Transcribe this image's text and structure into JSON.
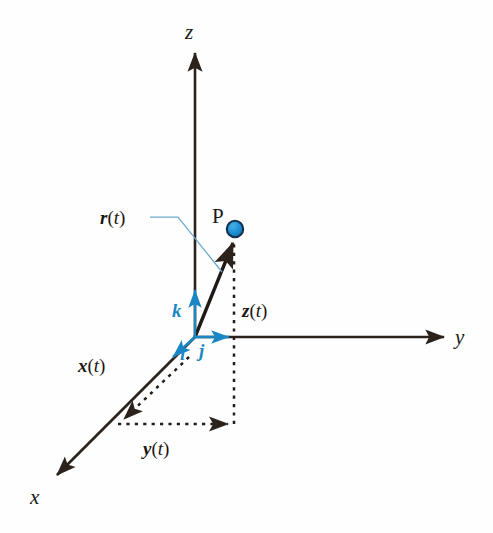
{
  "figure": {
    "background_color": "#fefefe",
    "width": 493,
    "height": 533,
    "colors": {
      "axis": "#2b221c",
      "accent_blue": "#1b86c4",
      "point_fill": "#1b8fd4",
      "point_edge": "#14324d",
      "leader_line": "#6aa9cf",
      "text": "#1d1713"
    }
  },
  "axes": [
    {
      "name": "z-axis",
      "label": "z",
      "direction": "up",
      "label_x": 185,
      "label_y": 22,
      "tip": [
        195,
        50
      ],
      "tail": [
        195,
        337
      ]
    },
    {
      "name": "y-axis",
      "label": "y",
      "direction": "right",
      "label_x": 455,
      "label_y": 327,
      "tip": [
        447,
        337
      ],
      "tail": [
        195,
        337
      ]
    },
    {
      "name": "x-axis",
      "label": "x",
      "direction": "down-left",
      "label_x": 30,
      "label_y": 487,
      "tip": [
        53,
        479
      ],
      "tail": [
        195,
        337
      ]
    }
  ],
  "point": {
    "name": "P",
    "label": "P",
    "label_x": 212,
    "label_y": 206,
    "center_x": 235,
    "center_y": 229,
    "radius": 8
  },
  "position_vector": {
    "name": "r(t)",
    "letter": "r",
    "open_paren": "(",
    "tvar": "t",
    "close_paren": ")",
    "label_x": 100,
    "label_y": 208,
    "from": [
      195,
      337
    ],
    "to": [
      232,
      240
    ],
    "leader_from": [
      150,
      217
    ],
    "leader_bend": [
      178,
      217
    ],
    "leader_to": [
      222,
      272
    ]
  },
  "components": [
    {
      "name": "x-component",
      "letter": "x",
      "open_paren": "(",
      "tvar": "t",
      "close_paren": ")",
      "label_x": 78,
      "label_y": 356,
      "from": [
        188,
        358
      ],
      "to": [
        120,
        423
      ],
      "style": "dashed"
    },
    {
      "name": "y-component",
      "letter": "y",
      "open_paren": "(",
      "tvar": "t",
      "close_paren": ")",
      "label_x": 143,
      "label_y": 439,
      "from": [
        118,
        424
      ],
      "to": [
        232,
        424
      ],
      "style": "dashed"
    },
    {
      "name": "z-component",
      "letter": "z",
      "open_paren": "(",
      "tvar": "t",
      "close_paren": ")",
      "label_x": 242,
      "label_y": 301,
      "from": [
        234,
        424
      ],
      "to": [
        234,
        236
      ],
      "style": "dashed"
    }
  ],
  "unit_vectors": [
    {
      "name": "i-hat",
      "label": "i",
      "label_x": 180,
      "label_y": 344,
      "from": [
        195,
        337
      ],
      "to": [
        170,
        360
      ],
      "color": "#1b86c4"
    },
    {
      "name": "j-hat",
      "label": "j",
      "label_x": 199,
      "label_y": 341,
      "from": [
        195,
        337
      ],
      "to": [
        232,
        337
      ],
      "color": "#1b86c4"
    },
    {
      "name": "k-hat",
      "label": "k",
      "label_x": 172,
      "label_y": 301,
      "from": [
        195,
        337
      ],
      "to": [
        195,
        287
      ],
      "color": "#1b86c4"
    }
  ]
}
